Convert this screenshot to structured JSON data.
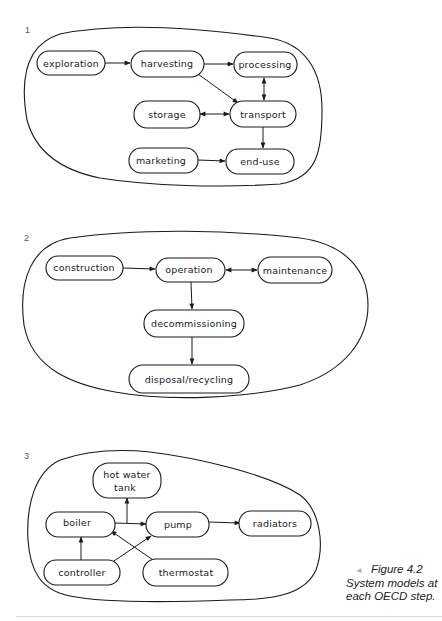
{
  "figure": {
    "caption_title": "Figure 4.2",
    "caption_line2": "System models at",
    "caption_line3": "each OECD step.",
    "caption_marker": "◄"
  },
  "panels": [
    {
      "number": "1",
      "nodes": [
        {
          "id": "exploration",
          "label": "exploration"
        },
        {
          "id": "harvesting",
          "label": "harvesting"
        },
        {
          "id": "processing",
          "label": "processing"
        },
        {
          "id": "storage",
          "label": "storage"
        },
        {
          "id": "transport",
          "label": "transport"
        },
        {
          "id": "marketing",
          "label": "marketing"
        },
        {
          "id": "end-use",
          "label": "end-use"
        }
      ],
      "edges": [
        {
          "from": "exploration",
          "to": "harvesting",
          "type": "directed"
        },
        {
          "from": "harvesting",
          "to": "processing",
          "type": "directed"
        },
        {
          "from": "harvesting",
          "to": "transport",
          "type": "directed"
        },
        {
          "from": "processing",
          "to": "transport",
          "type": "bidirectional"
        },
        {
          "from": "storage",
          "to": "transport",
          "type": "bidirectional"
        },
        {
          "from": "transport",
          "to": "end-use",
          "type": "directed"
        },
        {
          "from": "marketing",
          "to": "end-use",
          "type": "directed"
        }
      ]
    },
    {
      "number": "2",
      "nodes": [
        {
          "id": "construction",
          "label": "construction"
        },
        {
          "id": "operation",
          "label": "operation"
        },
        {
          "id": "maintenance",
          "label": "maintenance"
        },
        {
          "id": "decommissioning",
          "label": "decommissioning"
        },
        {
          "id": "disposal-recycling",
          "label": "disposal/recycling"
        }
      ],
      "edges": [
        {
          "from": "construction",
          "to": "operation",
          "type": "directed"
        },
        {
          "from": "operation",
          "to": "maintenance",
          "type": "bidirectional"
        },
        {
          "from": "operation",
          "to": "decommissioning",
          "type": "directed"
        },
        {
          "from": "decommissioning",
          "to": "disposal-recycling",
          "type": "directed"
        }
      ]
    },
    {
      "number": "3",
      "nodes": [
        {
          "id": "hot-water-tank",
          "label": "hot water",
          "label2": "tank"
        },
        {
          "id": "boiler",
          "label": "boiler"
        },
        {
          "id": "pump",
          "label": "pump"
        },
        {
          "id": "radiators",
          "label": "radiators"
        },
        {
          "id": "controller",
          "label": "controller"
        },
        {
          "id": "thermostat",
          "label": "thermostat"
        }
      ],
      "edges": [
        {
          "from": "boiler",
          "to": "pump",
          "type": "directed"
        },
        {
          "from": "boiler",
          "to": "hot-water-tank",
          "type": "directed"
        },
        {
          "from": "pump",
          "to": "radiators",
          "type": "directed"
        },
        {
          "from": "controller",
          "to": "boiler",
          "type": "directed"
        },
        {
          "from": "controller",
          "to": "pump",
          "type": "directed"
        },
        {
          "from": "thermostat",
          "to": "boiler",
          "type": "directed"
        }
      ]
    }
  ]
}
